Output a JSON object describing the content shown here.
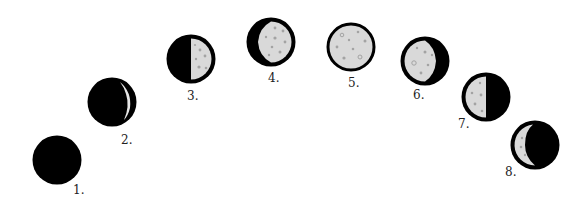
{
  "diagram": {
    "type": "moon-phase-sequence",
    "colors": {
      "dark": "#000000",
      "lit": "#d9d9d9",
      "crater": "#a3a3a3",
      "outline": "#000000",
      "label": "#222222",
      "background": "#ffffff"
    },
    "phases": [
      {
        "id": 1,
        "label": "1.",
        "phase": "new-moon"
      },
      {
        "id": 2,
        "label": "2.",
        "phase": "thin-waxing-crescent"
      },
      {
        "id": 3,
        "label": "3.",
        "phase": "first-quarter"
      },
      {
        "id": 4,
        "label": "4.",
        "phase": "waxing-gibbous"
      },
      {
        "id": 5,
        "label": "5.",
        "phase": "full-moon"
      },
      {
        "id": 6,
        "label": "6.",
        "phase": "waning-gibbous"
      },
      {
        "id": 7,
        "label": "7.",
        "phase": "last-quarter"
      },
      {
        "id": 8,
        "label": "8.",
        "phase": "waning-crescent"
      }
    ]
  }
}
